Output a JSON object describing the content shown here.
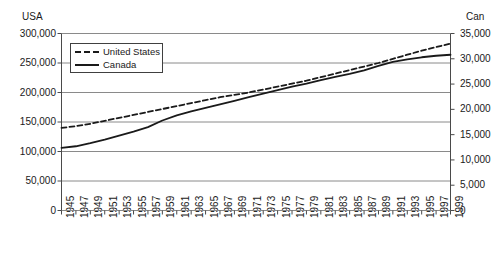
{
  "chart_data": {
    "type": "line",
    "title": "",
    "subtitle": "",
    "xlabel": "",
    "ylabel": "USA",
    "y2label": "Can",
    "grid": "horizontal",
    "legend_position": "top-left-inside",
    "ylim": [
      0,
      300000
    ],
    "y2lim": [
      0,
      35000
    ],
    "xlim": [
      1945,
      1999
    ],
    "ytick_labels": [
      "300,000",
      "250,000",
      "200,000",
      "150,000",
      "100,000",
      "50,000",
      "0"
    ],
    "ytick_values": [
      300000,
      250000,
      200000,
      150000,
      100000,
      50000,
      0
    ],
    "y2tick_labels": [
      "35,000",
      "30,000",
      "25,000",
      "20,000",
      "15,000",
      "10,000",
      "5,000",
      "0"
    ],
    "y2tick_values": [
      35000,
      30000,
      25000,
      20000,
      15000,
      10000,
      5000,
      0
    ],
    "x": [
      1945,
      1947,
      1949,
      1951,
      1953,
      1955,
      1957,
      1959,
      1961,
      1963,
      1965,
      1967,
      1969,
      1971,
      1973,
      1975,
      1977,
      1979,
      1981,
      1983,
      1985,
      1987,
      1989,
      1991,
      1993,
      1995,
      1997,
      1999
    ],
    "xtick_labels": [
      "1945",
      "1947",
      "1949",
      "1951",
      "1953",
      "1955",
      "1957",
      "1959",
      "1961",
      "1963",
      "1965",
      "1967",
      "1969",
      "1971",
      "1973",
      "1975",
      "1977",
      "1979",
      "1981",
      "1983",
      "1985",
      "1987",
      "1989",
      "1991",
      "1993",
      "1995",
      "1997",
      "1999"
    ],
    "series": [
      {
        "name": "United States",
        "axis": "left",
        "style": "dashed",
        "color": "#1a1a1a",
        "values": [
          140000,
          143000,
          147000,
          152000,
          157000,
          162000,
          167000,
          172000,
          177000,
          182000,
          187000,
          192000,
          196000,
          200000,
          205000,
          210000,
          215000,
          220000,
          226000,
          232000,
          238000,
          244000,
          250000,
          257000,
          264000,
          271000,
          277000,
          283000
        ]
      },
      {
        "name": "Canada",
        "axis": "right",
        "style": "solid",
        "color": "#1a1a1a",
        "values": [
          12400,
          12700,
          13300,
          14000,
          14800,
          15600,
          16500,
          17800,
          18800,
          19600,
          20300,
          21000,
          21700,
          22400,
          23100,
          23800,
          24500,
          25100,
          25800,
          26400,
          27000,
          27700,
          28600,
          29400,
          29900,
          30300,
          30600,
          30800
        ],
        "values_left_scale": [
          106000,
          109000,
          114000,
          120000,
          127000,
          134000,
          141000,
          152000,
          161000,
          168000,
          174000,
          180000,
          186000,
          192000,
          198000,
          204000,
          210000,
          215000,
          221000,
          226000,
          231000,
          237000,
          245000,
          252000,
          256000,
          260000,
          262000,
          264000
        ]
      }
    ]
  },
  "legend": {
    "items": [
      {
        "label": "United States",
        "style": "dashed"
      },
      {
        "label": "Canada",
        "style": "solid"
      }
    ]
  },
  "axes": {
    "left_title": "USA",
    "right_title": "Can"
  }
}
